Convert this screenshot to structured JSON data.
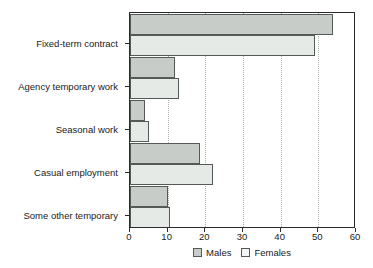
{
  "chart_data": {
    "type": "bar",
    "orientation": "horizontal",
    "title": "",
    "subtitle": "",
    "xlabel": "",
    "ylabel": "",
    "xlim": [
      0,
      60
    ],
    "ylim": null,
    "xticks": [
      "0",
      "10",
      "20",
      "30",
      "40",
      "50",
      "60"
    ],
    "xtick_values": [
      0,
      10,
      20,
      30,
      40,
      50,
      60
    ],
    "grid": "vertical-dotted",
    "legend_position": "bottom-center",
    "categories": [
      "Fixed-term contract",
      "Agency temporary work",
      "Seasonal work",
      "Casual employment",
      "Some other temporary"
    ],
    "series": [
      {
        "name": "Males",
        "color": "#c8ccc9",
        "values": [
          54,
          12,
          4,
          18.5,
          10
        ]
      },
      {
        "name": "Females",
        "color": "#e6eae7",
        "values": [
          49,
          13,
          5,
          22,
          10.5
        ]
      }
    ],
    "annotations": []
  },
  "legend": {
    "items": [
      {
        "label": "Males",
        "swatch": "males-swatch"
      },
      {
        "label": "Females",
        "swatch": "females-swatch"
      }
    ]
  }
}
